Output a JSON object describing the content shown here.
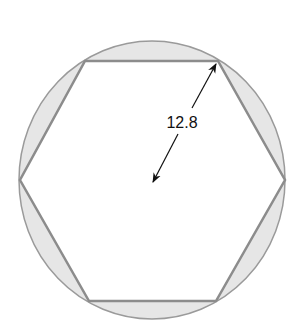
{
  "diagram": {
    "shapes": {
      "circle": {
        "label": "circumscribed circle"
      },
      "hexagon": {
        "label": "inscribed regular hexagon",
        "sides": 6
      }
    },
    "dimension": {
      "label": "12.8",
      "meaning": "radius from center to vertex"
    },
    "colors": {
      "segment_fill": "#e6e6e6",
      "stroke": "#8c8c8c",
      "hexagon_fill": "#ffffff",
      "arrow": "#111111"
    }
  }
}
